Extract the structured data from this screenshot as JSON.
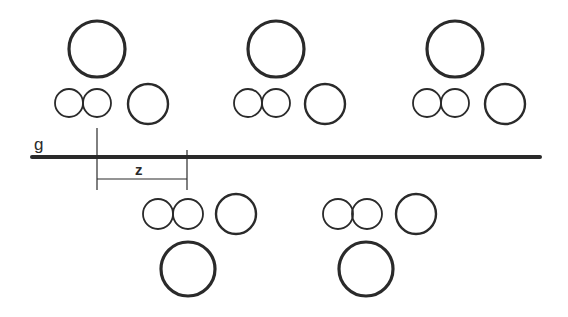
{
  "diagram": {
    "type": "periodic pattern along glide line",
    "colors": {
      "stroke": "#2a2a2a",
      "background": "#ffffff"
    },
    "labels": {
      "line_label": "g",
      "translation_label": "z"
    },
    "glide_line": {
      "x1": 32,
      "x2": 540,
      "y": 157,
      "width": 4
    },
    "translation": {
      "x1": 97,
      "x2": 187,
      "y": 179
    },
    "motifs_above": [
      {
        "large": [
          97,
          49,
          28
        ],
        "pair": [
          [
            69,
            103,
            14
          ],
          [
            97,
            103,
            14
          ]
        ],
        "single": [
          148,
          104,
          20
        ]
      },
      {
        "large": [
          276,
          49,
          28
        ],
        "pair": [
          [
            248,
            103,
            14
          ],
          [
            276,
            103,
            14
          ]
        ],
        "single": [
          325,
          104,
          20
        ]
      },
      {
        "large": [
          455,
          49,
          28
        ],
        "pair": [
          [
            427,
            103,
            14
          ],
          [
            455,
            103,
            14
          ]
        ],
        "single": [
          505,
          104,
          20
        ]
      }
    ],
    "motifs_below": [
      {
        "large": [
          188,
          269,
          27
        ],
        "pair": [
          [
            158,
            214,
            15
          ],
          [
            188,
            214,
            15
          ]
        ],
        "single": [
          236,
          214,
          20
        ]
      },
      {
        "large": [
          366,
          269,
          27
        ],
        "pair": [
          [
            338,
            214,
            15
          ],
          [
            367,
            214,
            15
          ]
        ],
        "single": [
          416,
          214,
          20
        ]
      }
    ]
  }
}
